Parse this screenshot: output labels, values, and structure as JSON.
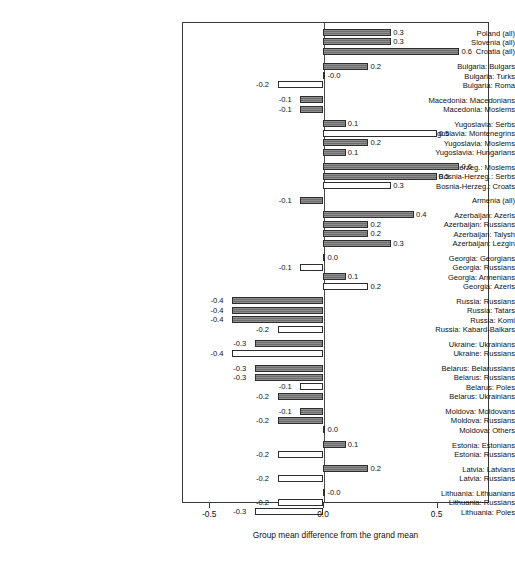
{
  "chart_data": {
    "type": "bar",
    "orientation": "horizontal",
    "title": "",
    "xlabel": "Group mean difference from the grand mean",
    "ylabel": "",
    "xlim": [
      -0.62,
      0.73
    ],
    "xticks": [
      -0.5,
      0.0,
      0.5
    ],
    "xticklabels": [
      "-0.5",
      "0.0",
      "0.5"
    ],
    "grid": false,
    "legend": null,
    "zero_reference_line": 0.0,
    "categories": [
      "Poland (all)",
      "Slovenia (all)",
      "Croatia (all)",
      "Bulgaria: Bulgars",
      "Bulgaria: Turks",
      "Bulgaria: Roma",
      "Macedonia: Macedonians",
      "Macedonia: Moslems",
      "Yugoslavia: Serbs",
      "Yugoslavia: Montenegrins",
      "Yugoslavia: Moslems",
      "Yugoslavia: Hungarians",
      "Bosnia-Herzeg.: Moslems",
      "Bosnia-Herzeg.: Serbs",
      "Bosnia-Herzeg.: Croats",
      "Armenia (all)",
      "Azerbaijan: Azeris",
      "Azerbaijan: Russians",
      "Azerbaijan: Talysh",
      "Azerbaijan: Lezgin",
      "Georgia: Georgians",
      "Georgia: Russians",
      "Georgia: Armenians",
      "Georgia: Azeris",
      "Russia: Russians",
      "Russia: Tatars",
      "Russia: Komi",
      "Russia: Kabard-Balkars",
      "Ukraine: Ukrainians",
      "Ukraine: Russians",
      "Belarus: Belarussians",
      "Belarus: Russians",
      "Belarus: Poles",
      "Belarus: Ukrainians",
      "Moldova: Moldovans",
      "Moldova: Russians",
      "Moldova: Others",
      "Estonia: Estonians",
      "Estonia: Russians",
      "Latvia: Latvians",
      "Latvia: Russians",
      "Lithuania: Lithuanians",
      "Lithuania: Russians",
      "Lithuania: Poles"
    ],
    "values": [
      0.3,
      0.3,
      0.6,
      0.2,
      -0.0,
      -0.2,
      -0.1,
      -0.1,
      0.1,
      0.5,
      0.2,
      0.1,
      0.6,
      0.5,
      0.3,
      -0.1,
      0.4,
      0.2,
      0.2,
      0.3,
      0.0,
      -0.1,
      0.1,
      0.2,
      -0.4,
      -0.4,
      -0.4,
      -0.2,
      -0.3,
      -0.4,
      -0.3,
      -0.3,
      -0.1,
      -0.2,
      -0.1,
      -0.2,
      0.0,
      0.1,
      -0.2,
      0.2,
      -0.2,
      -0.0,
      -0.2,
      -0.3
    ],
    "value_labels": [
      "0.3",
      "0.3",
      "0.6",
      "0.2",
      "-0.0",
      "-0.2",
      "-0.1",
      "-0.1",
      "0.1",
      "0.5",
      "0.2",
      "0.1",
      "0.6",
      "0.5",
      "0.3",
      "-0.1",
      "0.4",
      "0.2",
      "0.2",
      "0.3",
      "0.0",
      "-0.1",
      "0.1",
      "0.2",
      "-0.4",
      "-0.4",
      "-0.4",
      "-0.2",
      "-0.3",
      "-0.4",
      "-0.3",
      "-0.3",
      "-0.1",
      "-0.2",
      "-0.1",
      "-0.2",
      "0.0",
      "0.1",
      "-0.2",
      "0.2",
      "-0.2",
      "-0.0",
      "-0.2",
      "-0.3"
    ],
    "styles": [
      "filled",
      "filled",
      "filled",
      "filled",
      "hollow",
      "hollow",
      "filled",
      "filled",
      "filled",
      "hollow",
      "filled",
      "filled",
      "filled",
      "filled",
      "hollow",
      "filled",
      "filled",
      "filled",
      "filled",
      "filled",
      "filled",
      "hollow",
      "filled",
      "hollow",
      "filled",
      "filled",
      "filled",
      "hollow",
      "filled",
      "hollow",
      "filled",
      "filled",
      "hollow",
      "filled",
      "filled",
      "filled",
      "hollow",
      "filled",
      "hollow",
      "filled",
      "hollow",
      "filled",
      "hollow",
      "hollow"
    ],
    "group_breaks_after": [
      2,
      5,
      7,
      11,
      14,
      15,
      19,
      23,
      27,
      29,
      33,
      36,
      38,
      40
    ],
    "colors": {
      "filled_bar": "#6e6e6e",
      "hollow_bar": "#ffffff",
      "bar_outline": "#2e2e2e",
      "frame": "#3a3a3a",
      "text": "#111111",
      "background": "#ffffff"
    }
  }
}
